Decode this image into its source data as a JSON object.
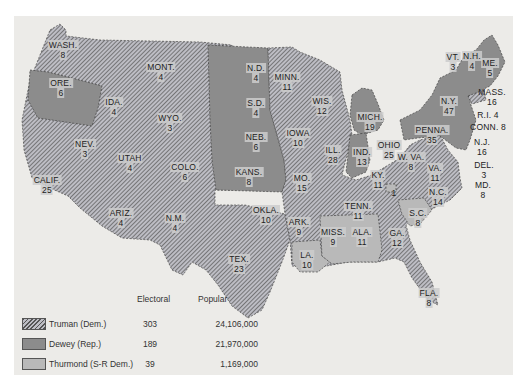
{
  "colors": {
    "panel_bg": "#ecebe8",
    "truman_hatch_dark": "#555555",
    "truman_hatch_light": "#bdbdc4",
    "dewey": "#8c8c8c",
    "thurmond": "#b9b9b9"
  },
  "legend": {
    "col_electoral": "Electoral",
    "col_popular": "Popular",
    "rows": [
      {
        "candidate": "Truman (Dem.)",
        "pattern": "hatched",
        "electoral": "303",
        "popular": "24,106,000"
      },
      {
        "candidate": "Dewey (Rep.)",
        "pattern": "dark-gray",
        "electoral": "189",
        "popular": "21,970,000"
      },
      {
        "candidate": "Thurmond (S-R Dem.)",
        "pattern": "light-gray",
        "electoral": "39",
        "popular": "1,169,000"
      }
    ]
  },
  "states": [
    {
      "name": "WASH.",
      "votes": "8",
      "winner": "Truman",
      "x": 63,
      "y": 40
    },
    {
      "name": "ORE.",
      "votes": "6",
      "winner": "Dewey",
      "x": 61,
      "y": 78
    },
    {
      "name": "CALIF.",
      "votes": "25",
      "winner": "Truman",
      "x": 47,
      "y": 175
    },
    {
      "name": "NEV.",
      "votes": "3",
      "winner": "Truman",
      "x": 85,
      "y": 139
    },
    {
      "name": "IDA.",
      "votes": "4",
      "winner": "Truman",
      "x": 114,
      "y": 97
    },
    {
      "name": "MONT.",
      "votes": "4",
      "winner": "Truman",
      "x": 161,
      "y": 62
    },
    {
      "name": "WYO.",
      "votes": "3",
      "winner": "Truman",
      "x": 170,
      "y": 113
    },
    {
      "name": "UTAH",
      "votes": "4",
      "winner": "Truman",
      "x": 130,
      "y": 153
    },
    {
      "name": "COLO.",
      "votes": "6",
      "winner": "Truman",
      "x": 185,
      "y": 162
    },
    {
      "name": "ARIZ.",
      "votes": "4",
      "winner": "Truman",
      "x": 121,
      "y": 208
    },
    {
      "name": "N.M.",
      "votes": "4",
      "winner": "Truman",
      "x": 175,
      "y": 213
    },
    {
      "name": "N.D.",
      "votes": "4",
      "winner": "Dewey",
      "x": 256,
      "y": 63
    },
    {
      "name": "S.D.",
      "votes": "4",
      "winner": "Dewey",
      "x": 256,
      "y": 98
    },
    {
      "name": "NEB.",
      "votes": "6",
      "winner": "Dewey",
      "x": 256,
      "y": 132
    },
    {
      "name": "KANS.",
      "votes": "8",
      "winner": "Dewey",
      "x": 249,
      "y": 167
    },
    {
      "name": "OKLA.",
      "votes": "10",
      "winner": "Truman",
      "x": 266,
      "y": 205
    },
    {
      "name": "TEX.",
      "votes": "23",
      "winner": "Truman",
      "x": 239,
      "y": 254
    },
    {
      "name": "MINN.",
      "votes": "11",
      "winner": "Truman",
      "x": 287,
      "y": 72
    },
    {
      "name": "IOWA",
      "votes": "10",
      "winner": "Truman",
      "x": 298,
      "y": 128
    },
    {
      "name": "MO.",
      "votes": "15",
      "winner": "Truman",
      "x": 302,
      "y": 173
    },
    {
      "name": "ARK.",
      "votes": "9",
      "winner": "Truman",
      "x": 299,
      "y": 217
    },
    {
      "name": "LA.",
      "votes": "10",
      "winner": "Thurmond",
      "x": 307,
      "y": 250
    },
    {
      "name": "WIS.",
      "votes": "12",
      "winner": "Truman",
      "x": 322,
      "y": 96
    },
    {
      "name": "ILL.",
      "votes": "28",
      "winner": "Truman",
      "x": 333,
      "y": 145
    },
    {
      "name": "MICH.",
      "votes": "19",
      "winner": "Dewey",
      "x": 370,
      "y": 112
    },
    {
      "name": "IND.",
      "votes": "13",
      "winner": "Dewey",
      "x": 362,
      "y": 147
    },
    {
      "name": "OHIO",
      "votes": "25",
      "winner": "Truman",
      "x": 389,
      "y": 140
    },
    {
      "name": "KY.",
      "votes": "11",
      "winner": "Truman",
      "x": 378,
      "y": 170
    },
    {
      "name": "TENN.",
      "votes": "11",
      "winner": "Truman",
      "x": 358,
      "y": 201
    },
    {
      "name": "MISS.",
      "votes": "9",
      "winner": "Thurmond",
      "x": 333,
      "y": 227
    },
    {
      "name": "ALA.",
      "votes": "11",
      "winner": "Thurmond",
      "x": 362,
      "y": 227
    },
    {
      "name": "GA.",
      "votes": "12",
      "winner": "Truman",
      "x": 397,
      "y": 228
    },
    {
      "name": "FLA.",
      "votes": "8",
      "winner": "Truman",
      "x": 429,
      "y": 288
    },
    {
      "name": "S.C.",
      "votes": "8",
      "winner": "Thurmond",
      "x": 418,
      "y": 208
    },
    {
      "name": "N.C.",
      "votes": "14",
      "winner": "Truman",
      "x": 438,
      "y": 187
    },
    {
      "name": "VA.",
      "votes": "11",
      "winner": "Truman",
      "x": 435,
      "y": 163
    },
    {
      "name": "W. VA.",
      "votes": "8",
      "winner": "Truman",
      "x": 411,
      "y": 152
    },
    {
      "name": "PENNA.",
      "votes": "35",
      "winner": "Dewey",
      "x": 432,
      "y": 125
    },
    {
      "name": "N.Y.",
      "votes": "47",
      "winner": "Dewey",
      "x": 449,
      "y": 96
    },
    {
      "name": "VT.",
      "votes": "3",
      "winner": "Dewey",
      "x": 453,
      "y": 52
    },
    {
      "name": "N.H.",
      "votes": "4",
      "winner": "Dewey",
      "x": 472,
      "y": 51
    },
    {
      "name": "ME.",
      "votes": "5",
      "winner": "Dewey",
      "x": 490,
      "y": 58
    }
  ],
  "callouts": [
    {
      "name": "MASS.",
      "votes": "16",
      "winner": "Dewey",
      "x": 492,
      "y": 87
    },
    {
      "name": "R.I.",
      "votes": "4",
      "winner": "Truman",
      "x": 488,
      "y": 110
    },
    {
      "name": "CONN.",
      "votes": "8",
      "winner": "Dewey",
      "x": 488,
      "y": 122
    },
    {
      "name": "N.J.",
      "votes": "16",
      "winner": "Dewey",
      "x": 482,
      "y": 137
    },
    {
      "name": "DEL.",
      "votes": "3",
      "winner": "Dewey",
      "x": 484,
      "y": 160
    },
    {
      "name": "MD.",
      "votes": "8",
      "winner": "Dewey",
      "x": 483,
      "y": 180
    }
  ],
  "tennessee_split": {
    "votes": "1",
    "winner": "Thurmond",
    "x": 394,
    "y": 188
  }
}
